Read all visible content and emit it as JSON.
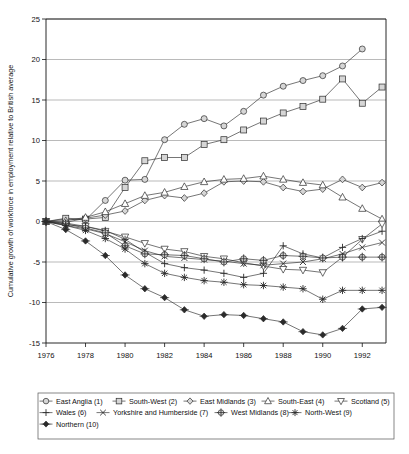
{
  "chart_data": {
    "type": "line",
    "title": "",
    "xlabel": "",
    "ylabel": "Cumulative growth of workforce in employment relative to British average",
    "xlim": [
      1976,
      1993
    ],
    "ylim": [
      -15,
      25
    ],
    "yticks": [
      -15,
      -10,
      -5,
      0,
      5,
      10,
      15,
      20,
      25
    ],
    "xticks": [
      1976,
      1978,
      1980,
      1982,
      1984,
      1986,
      1988,
      1990,
      1992
    ],
    "xtick_labels": [
      "1976",
      "1978",
      "1980",
      "1982",
      "1984",
      "1986",
      "1988",
      "1990",
      "1992"
    ],
    "ytick_labels": [
      "-15",
      "-10",
      "-5",
      "0",
      "5",
      "10",
      "15",
      "20",
      "25"
    ],
    "grid": true,
    "legend_position": "bottom",
    "x": [
      1976,
      1977,
      1978,
      1979,
      1980,
      1981,
      1982,
      1983,
      1984,
      1985,
      1986,
      1987,
      1988,
      1989,
      1990,
      1991,
      1992,
      1993
    ],
    "series": [
      {
        "name": "East Anglia (1)",
        "marker": "circle",
        "values": [
          0,
          0.3,
          0.2,
          2.6,
          5.1,
          5.2,
          10.1,
          12.0,
          12.7,
          11.8,
          13.6,
          15.6,
          16.7,
          17.4,
          18.0,
          19.2,
          21.3,
          null
        ]
      },
      {
        "name": "South-West (2)",
        "marker": "square",
        "values": [
          0,
          0.4,
          0.3,
          0.5,
          4.2,
          7.5,
          7.9,
          7.9,
          9.5,
          10.1,
          11.3,
          12.4,
          13.4,
          14.2,
          15.1,
          17.6,
          14.6,
          16.6
        ]
      },
      {
        "name": "East Midlands (3)",
        "marker": "diamond",
        "values": [
          0,
          -0.1,
          0.4,
          0.8,
          1.3,
          2.6,
          3.2,
          2.9,
          3.5,
          4.9,
          5.0,
          4.9,
          4.2,
          3.7,
          4.0,
          5.2,
          4.2,
          4.8
        ]
      },
      {
        "name": "South-East (4)",
        "marker": "triangle-up",
        "values": [
          0,
          0.1,
          0.5,
          1.2,
          2.2,
          3.2,
          3.6,
          4.3,
          4.9,
          5.2,
          5.3,
          5.6,
          5.2,
          4.8,
          4.5,
          3.0,
          1.6,
          0.3
        ]
      },
      {
        "name": "Scotland (5)",
        "marker": "triangle-down",
        "values": [
          0,
          -0.4,
          -0.6,
          -1.2,
          -1.9,
          -2.7,
          -3.4,
          -3.7,
          -4.3,
          -4.6,
          -5.1,
          -5.5,
          -5.9,
          -6.0,
          -6.3,
          -4.4,
          -2.2,
          -0.3
        ]
      },
      {
        "name": "Wales (6)",
        "marker": "plus",
        "values": [
          0,
          -0.2,
          -0.6,
          -1.1,
          -2.2,
          -3.8,
          -5.2,
          -5.7,
          -6.0,
          -6.4,
          -6.9,
          -6.4,
          -3.0,
          -4.0,
          -4.5,
          -3.2,
          -2.1,
          -1.2
        ]
      },
      {
        "name": "Yorkshire and Humberside (7)",
        "marker": "x",
        "values": [
          0,
          -0.5,
          -0.9,
          -1.5,
          -2.5,
          -3.6,
          -4.3,
          -4.5,
          -4.7,
          -4.9,
          -5.2,
          -5.4,
          -5.2,
          -5.0,
          -4.6,
          -4.0,
          -3.2,
          -2.6
        ]
      },
      {
        "name": "West Midlands (8)",
        "marker": "circle-plus",
        "values": [
          0,
          -0.3,
          -0.8,
          -1.4,
          -3.0,
          -4.0,
          -4.1,
          -4.2,
          -4.6,
          -5.0,
          -4.6,
          -4.8,
          -4.2,
          -4.3,
          -4.5,
          -4.4,
          -4.4,
          -4.4
        ]
      },
      {
        "name": "North-West (9)",
        "marker": "asterisk",
        "values": [
          0,
          -0.5,
          -1.1,
          -2.1,
          -3.4,
          -5.2,
          -6.4,
          -6.9,
          -7.3,
          -7.5,
          -7.8,
          -7.9,
          -8.1,
          -8.3,
          -9.6,
          -8.5,
          -8.5,
          -8.5
        ]
      },
      {
        "name": "Northern (10)",
        "marker": "diamond-filled",
        "values": [
          0,
          -1.0,
          -2.4,
          -4.2,
          -6.6,
          -8.3,
          -9.4,
          -10.9,
          -11.7,
          -11.5,
          -11.6,
          -12.0,
          -12.4,
          -13.6,
          -14.0,
          -13.2,
          -10.8,
          -10.6
        ]
      }
    ]
  },
  "legend": {
    "rows": [
      [
        "East Anglia (1)",
        "South-West (2)",
        "East Midlands (3)",
        "South-East (4)",
        "Scotland (5)"
      ],
      [
        "Wales (6)",
        "Yorkshire and Humberside (7)",
        "West Midlands (8)",
        "North-West (9)"
      ],
      [
        "Northern (10)"
      ]
    ]
  },
  "colors": {
    "line": "#2b2b2b",
    "grid": "#8c8c8c",
    "axis": "#111111",
    "marker_fill": "#d6d6d6",
    "background": "#ffffff"
  }
}
